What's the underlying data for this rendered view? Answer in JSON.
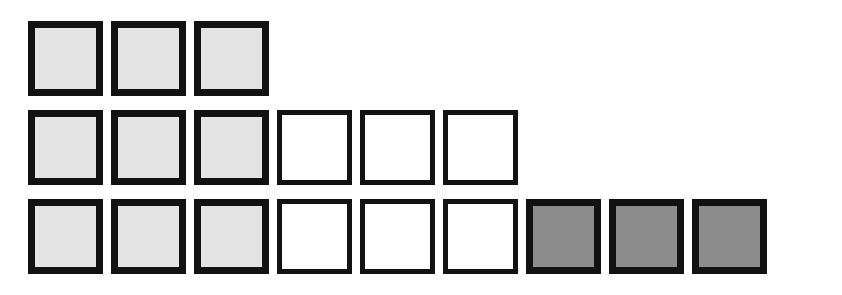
{
  "figure": {
    "canvas": {
      "width": 842,
      "height": 295,
      "background": "#ffffff"
    },
    "geometry": {
      "cell_size": 75,
      "column_pitch": 83,
      "row_pitch": 89,
      "origin_x": 28,
      "origin_y": 21,
      "border_width_filled": 7,
      "border_width_empty": 5
    },
    "palette": {
      "border": "#121212",
      "light_fill": "#e3e3e3",
      "empty_fill": "#ffffff",
      "dark_fill": "#8c8c8c"
    },
    "legend": {
      "light_label": "light-gray square",
      "empty_label": "white square",
      "dark_label": "dark-gray square"
    },
    "rows": [
      {
        "name": "row-1",
        "index": 1,
        "count": 3,
        "cells": [
          {
            "col": 1,
            "kind": "light"
          },
          {
            "col": 2,
            "kind": "light"
          },
          {
            "col": 3,
            "kind": "light"
          }
        ]
      },
      {
        "name": "row-2",
        "index": 2,
        "count": 6,
        "cells": [
          {
            "col": 1,
            "kind": "light"
          },
          {
            "col": 2,
            "kind": "light"
          },
          {
            "col": 3,
            "kind": "light"
          },
          {
            "col": 4,
            "kind": "empty"
          },
          {
            "col": 5,
            "kind": "empty"
          },
          {
            "col": 6,
            "kind": "empty"
          }
        ]
      },
      {
        "name": "row-3",
        "index": 3,
        "count": 9,
        "cells": [
          {
            "col": 1,
            "kind": "light"
          },
          {
            "col": 2,
            "kind": "light"
          },
          {
            "col": 3,
            "kind": "light"
          },
          {
            "col": 4,
            "kind": "empty"
          },
          {
            "col": 5,
            "kind": "empty"
          },
          {
            "col": 6,
            "kind": "empty"
          },
          {
            "col": 7,
            "kind": "dark"
          },
          {
            "col": 8,
            "kind": "dark"
          },
          {
            "col": 9,
            "kind": "dark"
          }
        ]
      }
    ]
  }
}
